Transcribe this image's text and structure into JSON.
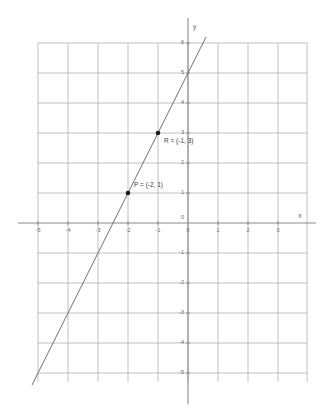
{
  "chart_data": {
    "type": "line",
    "title": "",
    "xlabel": "x",
    "ylabel": "y",
    "xlim": [
      -5.5,
      3.5
    ],
    "ylim": [
      -5.5,
      6.5
    ],
    "grid": true,
    "legend": "none",
    "x_ticks": [
      "-5",
      "-4",
      "-3",
      "-2",
      "-1",
      "0",
      "1",
      "2",
      "3"
    ],
    "x_tick_values": [
      -5,
      -4,
      -3,
      -2,
      -1,
      0,
      1,
      2,
      3
    ],
    "y_ticks": [
      "6",
      "5",
      "4",
      "3",
      "2",
      "1",
      "0",
      "-1",
      "-2",
      "-3",
      "-4",
      "-5"
    ],
    "y_tick_values": [
      6,
      5,
      4,
      3,
      2,
      1,
      0,
      -1,
      -2,
      -3,
      -4,
      -5
    ],
    "origin_label": "0",
    "series": [
      {
        "name": "line through P and R",
        "equation": "y = 2x + 5",
        "slope": 2,
        "intercept": 5,
        "x": [
          -5.2,
          0.6
        ],
        "values": [
          -5.4,
          6.2
        ]
      }
    ],
    "points": [
      {
        "name": "P",
        "label": "P = (-2, 1)",
        "x": -2,
        "y": 1,
        "label_dx": 6,
        "label_dy": -8
      },
      {
        "name": "R",
        "label": "R = (-1, 3)",
        "x": -1,
        "y": 3,
        "label_dx": 6,
        "label_dy": 8
      }
    ],
    "colors": {
      "grid": "#b9b9b9",
      "axis": "#8a8a8a",
      "line": "#6f6f6f",
      "point": "#1a1a1a",
      "tick_text": "#6b6b6b",
      "label_text": "#3d3d3d",
      "background": "#ffffff"
    }
  },
  "axis_labels": {
    "x": "x",
    "y": "y"
  }
}
